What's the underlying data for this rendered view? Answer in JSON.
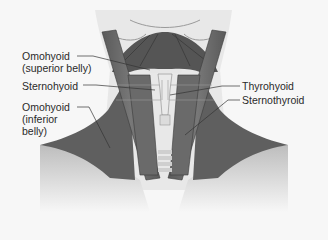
{
  "figure": {
    "colors": {
      "background": "#f7f7f7",
      "skin": "#ececec",
      "muscle_dark": "#4a4a4a",
      "muscle_mid": "#6a6a6a",
      "muscle_light": "#8c8c8c",
      "cartilage": "#e0e0e0",
      "leader_line": "#333333"
    },
    "labels": {
      "omohyoid_superior": {
        "line1": "Omohyoid",
        "line2": "(superior belly)"
      },
      "sternohyoid": {
        "line1": "Sternohyoid"
      },
      "omohyoid_inferior": {
        "line1": "Omohyoid",
        "line2": "(inferior",
        "line3": "belly)"
      },
      "thyrohyoid": {
        "line1": "Thyrohyoid"
      },
      "sternothyroid": {
        "line1": "Sternothyroid"
      }
    }
  }
}
